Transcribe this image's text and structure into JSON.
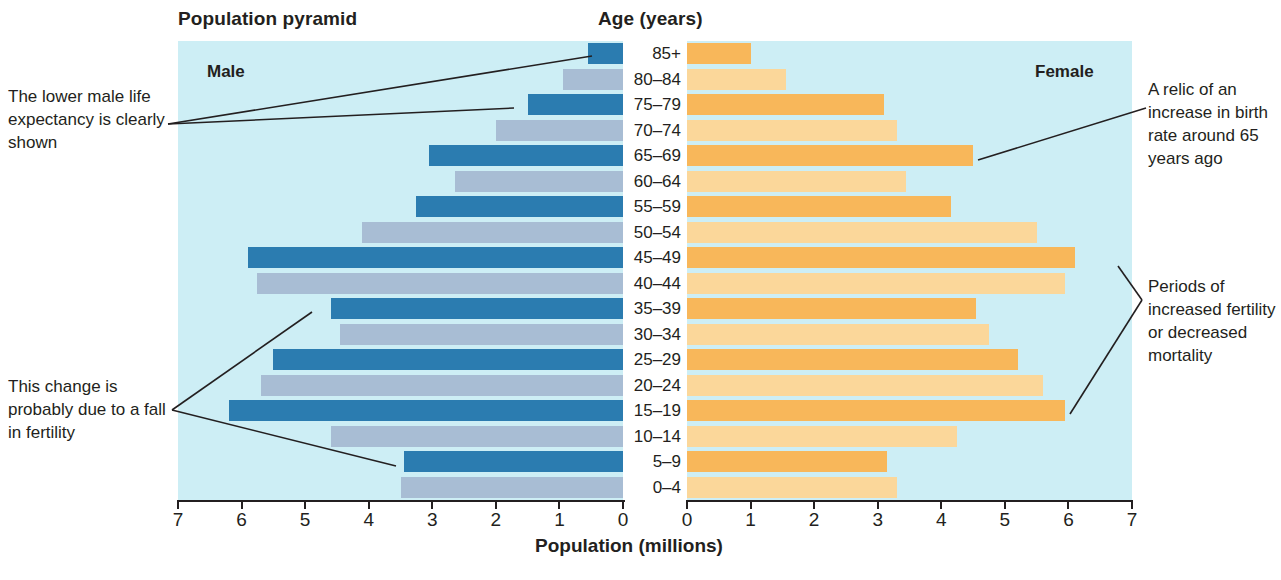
{
  "titles": {
    "pyramid": "Population pyramid",
    "age": "Age (years)",
    "axis": "Population (millions)",
    "male": "Male",
    "female": "Female"
  },
  "annotations": {
    "left_top": "The lower male life expectancy is clearly shown",
    "left_bottom": "This change is probably due to a fall in fertility",
    "right_top": "A relic of an increase in birth rate around 65 years ago",
    "right_bottom": "Periods of increased fertility or decreased mortality"
  },
  "colors": {
    "panel_bg": "#cdeef5",
    "male_dark": "#2b7cb0",
    "male_light": "#a8bdd4",
    "female_dark": "#f8b75a",
    "female_light": "#fbd79a",
    "axis": "#231f20"
  },
  "chart_data": {
    "type": "bar",
    "title": "Population pyramid",
    "xlabel": "Population (millions)",
    "ylabel": "Age (years)",
    "orientation": "horizontal-diverging",
    "grid": false,
    "legend_position": "in-plot",
    "xlim_left": [
      7,
      0
    ],
    "xlim_right": [
      0,
      7
    ],
    "xticks_left": [
      "7",
      "6",
      "5",
      "4",
      "3",
      "2",
      "1",
      "0"
    ],
    "xticks_right": [
      "0",
      "1",
      "2",
      "3",
      "4",
      "5",
      "6",
      "7"
    ],
    "categories": [
      "85+",
      "80–84",
      "75–79",
      "70–74",
      "65–69",
      "60–64",
      "55–59",
      "50–54",
      "45–49",
      "40–44",
      "35–39",
      "30–34",
      "25–29",
      "20–24",
      "15–19",
      "10–14",
      "5–9",
      "0–4"
    ],
    "series": [
      {
        "name": "Male",
        "side": "left",
        "values": [
          0.55,
          0.95,
          1.5,
          2.0,
          3.05,
          2.65,
          3.25,
          4.1,
          5.9,
          5.75,
          4.6,
          4.45,
          5.5,
          5.7,
          6.2,
          4.6,
          3.45,
          3.5
        ]
      },
      {
        "name": "Female",
        "side": "right",
        "values": [
          1.0,
          1.55,
          3.1,
          3.3,
          4.5,
          3.45,
          4.15,
          5.5,
          6.1,
          5.95,
          4.55,
          4.75,
          5.2,
          5.6,
          5.95,
          4.25,
          3.15,
          3.3
        ]
      }
    ],
    "bar_shading": "alternating dark/light by 5-year band, dark on odd index starting at 85+"
  }
}
